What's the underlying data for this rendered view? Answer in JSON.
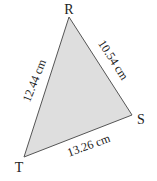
{
  "diagram": {
    "type": "triangle",
    "fill_color": "#dedede",
    "stroke_color": "#555555",
    "vertices": {
      "R": {
        "label": "R"
      },
      "S": {
        "label": "S"
      },
      "T": {
        "label": "T"
      }
    },
    "sides": {
      "RT": {
        "label": "12.44 cm"
      },
      "RS": {
        "label": "10.54 cm"
      },
      "TS": {
        "label": "13.26 cm"
      }
    }
  }
}
